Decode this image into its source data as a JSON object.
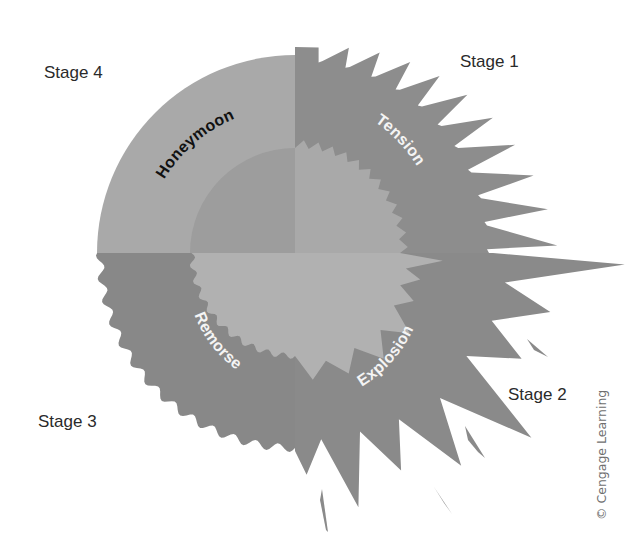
{
  "diagram": {
    "center": [
      295,
      253
    ],
    "outer_radius": 198,
    "inner_radius": 105,
    "colors": {
      "background": "#ffffff",
      "honeymoon_outer": "#a9a9a9",
      "tension_outer": "#8d8d8d",
      "remorse_outer": "#888888",
      "explosion_outer": "#8a8a8a",
      "inner_top_left": "#9d9d9d",
      "inner_top_right": "#a9a9a9",
      "inner_bottom": "#b1b1b1",
      "label_dark": "#111111",
      "label_light": "#f4f4f4"
    },
    "phases": [
      {
        "key": "tension",
        "label": "Tension",
        "stage": "Stage 1"
      },
      {
        "key": "explosion",
        "label": "Explosion",
        "stage": "Stage 2"
      },
      {
        "key": "remorse",
        "label": "Remorse",
        "stage": "Stage 3"
      },
      {
        "key": "honeymoon",
        "label": "Honeymoon",
        "stage": "Stage 4"
      }
    ]
  },
  "stages": {
    "stage1": "Stage 1",
    "stage2": "Stage 2",
    "stage3": "Stage 3",
    "stage4": "Stage 4"
  },
  "labels": {
    "tension": "Tension",
    "explosion": "Explosion",
    "remorse": "Remorse",
    "honeymoon": "Honeymoon"
  },
  "credit": "© Cengage Learning"
}
